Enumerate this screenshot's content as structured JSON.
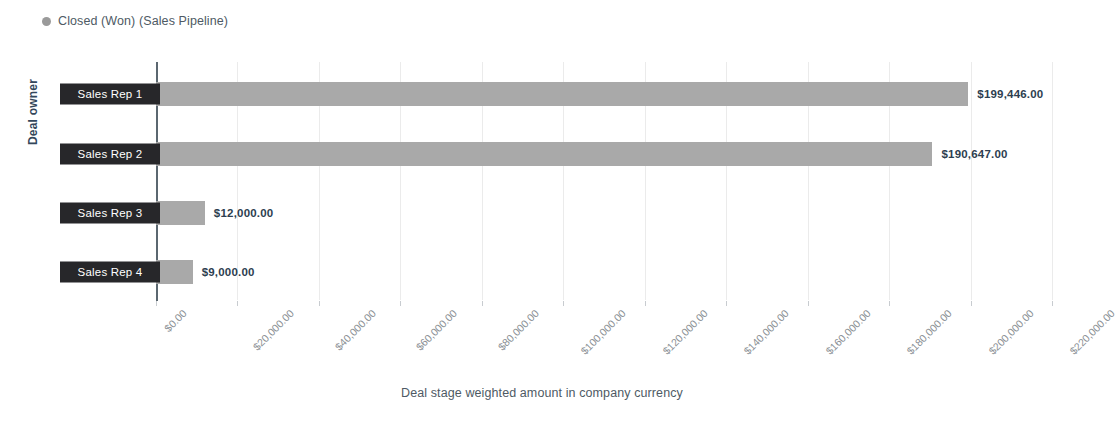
{
  "legend": {
    "marker_icon": "legend-dot-icon",
    "label": "Closed (Won) (Sales Pipeline)",
    "color": "#9a9a9a"
  },
  "chart_data": {
    "type": "bar",
    "orientation": "horizontal",
    "title": "",
    "xlabel": "Deal stage weighted amount in company currency",
    "ylabel": "Deal owner",
    "categories": [
      "Sales Rep 1",
      "Sales Rep 2",
      "Sales Rep 3",
      "Sales Rep 4"
    ],
    "values": [
      199446,
      190647,
      12000,
      9000
    ],
    "value_labels": [
      "$199,446.00",
      "$190,647.00",
      "$12,000.00",
      "$9,000.00"
    ],
    "series": [
      {
        "name": "Closed (Won) (Sales Pipeline)",
        "color": "#a9a9a9",
        "values": [
          199446,
          190647,
          12000,
          9000
        ]
      }
    ],
    "xlim": [
      0,
      220000
    ],
    "xtick_values": [
      0,
      20000,
      40000,
      60000,
      80000,
      100000,
      120000,
      140000,
      160000,
      180000,
      200000,
      220000
    ],
    "xtick_labels": [
      "$0.00",
      "$20,000.00",
      "$40,000.00",
      "$60,000.00",
      "$80,000.00",
      "$100,000.00",
      "$120,000.00",
      "$140,000.00",
      "$160,000.00",
      "$180,000.00",
      "$200,000.00",
      "$220,000.00"
    ],
    "grid": true,
    "grid_axis": "x",
    "legend_position": "top-left",
    "bar_color": "#a9a9a9",
    "category_label_style": "dark-badge",
    "category_label_bg": "#27272a",
    "category_label_color": "#ffffff"
  }
}
